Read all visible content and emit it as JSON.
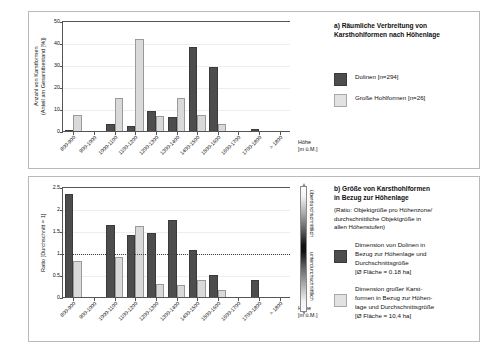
{
  "chart_data": [
    {
      "type": "bar",
      "id": "chart-a",
      "title": "a) Räumliche Verbreitung von Karsthohlformen nach Höhenlage",
      "xlabel": "Höhe [m ü.M.]",
      "ylabel": "Anzahl von Karstformen (Anteil am Gesamtbestand [%])",
      "ylim": [
        0,
        50
      ],
      "yticks": [
        0,
        10,
        20,
        30,
        40,
        50
      ],
      "grid": true,
      "legend_position": "right",
      "categories": [
        "800-900",
        "900-1000",
        "1000-1100",
        "1100-1200",
        "1200-1300",
        "1300-1400",
        "1400-1500",
        "1500-1600",
        "1600-1700",
        "1700-1800",
        "> 1800"
      ],
      "series": [
        {
          "name": "Dolinen [n=294]",
          "color": "#4d4d4d",
          "values": [
            1.0,
            0.0,
            3.6,
            2.7,
            9.4,
            6.8,
            38.6,
            29.5,
            0.0,
            1.5,
            0.0
          ]
        },
        {
          "name": "Große Hohlformen [n=26]",
          "color": "#d9d9d9",
          "values": [
            7.7,
            0.0,
            15.4,
            42.3,
            7.3,
            15.4,
            7.7,
            3.5,
            0.0,
            0.0,
            0.0
          ]
        }
      ]
    },
    {
      "type": "bar",
      "id": "chart-b",
      "title": "b) Größe von Karsthohlformen in Bezug zur Höhenlage",
      "subtitle": "(Ratio: Objektgröße pro Höhenzone/ durchschnittliche Objektgröße in allen Höhenstufen)",
      "xlabel": "Höhe [m ü.M.]",
      "ylabel": "Ratio [Durchschnitt = 1]",
      "ylim": [
        0,
        2.5
      ],
      "yticks": [
        0,
        0.5,
        1,
        1.5,
        2,
        2.5
      ],
      "reference_line": 1.0,
      "grid": true,
      "categories": [
        "800-900",
        "900-1000",
        "1000-1100",
        "1100-1200",
        "1200-1300",
        "1300-1400",
        "1400-1500",
        "1500-1600",
        "1600-1700",
        "1700-1800",
        "> 1800"
      ],
      "series": [
        {
          "name": "Dimension von Dolinen in Bezug zur Höhenlage und Durchschnittsgröße [Ø Fläche = 0.18 ha]",
          "color": "#4d4d4d",
          "values": [
            2.37,
            0.0,
            1.65,
            1.44,
            1.48,
            1.78,
            1.08,
            0.52,
            0.0,
            0.41,
            0.0
          ]
        },
        {
          "name": "Dimension großer Karstformen in Bezug zur Höhenlage und Durchschnittsgröße [Ø Fläche = 10,4 ha]",
          "color": "#d9d9d9",
          "values": [
            0.85,
            0.0,
            0.93,
            1.64,
            0.31,
            0.3,
            0.4,
            0.18,
            0.0,
            0.0,
            0.0
          ]
        }
      ]
    }
  ],
  "panel_a": {
    "title_line1": "a) Räumliche Verbreitung von",
    "title_line2": "Karsthohlformen nach Höhenlage",
    "ylabel_line1": "Anzahl von Karstformen",
    "ylabel_line2": "(Anteil am Gesamtbestand [%])",
    "xaxis_line1": "Höhe",
    "xaxis_line2": "[m ü.M.]",
    "yticks": [
      "0",
      "10",
      "20",
      "30",
      "40",
      "50"
    ],
    "xticks": [
      "800-900",
      "900-1000",
      "1000-1100",
      "1100-1200",
      "1200-1300",
      "1300-1400",
      "1400-1500",
      "1500-1600",
      "1600-1700",
      "1700-1800",
      "> 1800"
    ],
    "legend": [
      {
        "label": "Dolinen [n=294]",
        "swatch": "dark"
      },
      {
        "label": "Große Hohlformen [n=26]",
        "swatch": "light"
      }
    ]
  },
  "panel_b": {
    "title_line1": "b) Größe von Karsthohlformen",
    "title_line2": "in Bezug zur Höhenlage",
    "subtitle_line1": "(Ratio: Objektgröße pro Höhenzone/",
    "subtitle_line2": "durchschnittliche Objektgröße in",
    "subtitle_line3": "allen Höhenstufen)",
    "ylabel": "Ratio [Durchschnitt = 1]",
    "xaxis_line1": "Höhe",
    "xaxis_line2": "[m ü.M.]",
    "yticks": [
      "0",
      "0.5",
      "1",
      "1.5",
      "2",
      "2.5"
    ],
    "xticks": [
      "800-900",
      "900-1000",
      "1000-1100",
      "1100-1200",
      "1200-1300",
      "1300-1400",
      "1400-1500",
      "1500-1600",
      "1600-1700",
      "1700-1800",
      "> 1800"
    ],
    "gradient": {
      "top_label": "überdurchschnittlich",
      "bottom_label": "unterdurchschnittlich"
    },
    "legend": [
      {
        "swatch": "dark",
        "line1": "Dimension von Dolinen in",
        "line2": "Bezug zur Höhenlage und",
        "line3": "Durchschnittsgröße",
        "line4": "[Ø Fläche = 0.18 ha]"
      },
      {
        "swatch": "light",
        "line1": "Dimension großer Karst-",
        "line2": "formen in Bezug zur Höhen-",
        "line3": "lage und Durchschnittsgröße",
        "line4": "[Ø Fläche = 10,4 ha]"
      }
    ]
  },
  "colors": {
    "dark_series": "#4d4d4d",
    "light_series": "#d9d9d9",
    "axis": "#555555",
    "grid": "#eeeeee"
  }
}
